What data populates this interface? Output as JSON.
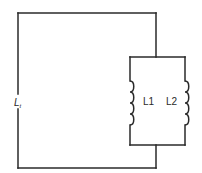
{
  "diagram": {
    "type": "circuit",
    "labels": {
      "total": {
        "main": "L",
        "subscript": "t"
      },
      "inductor1": "L1",
      "inductor2": "L2"
    },
    "components": [
      {
        "id": "L1",
        "kind": "inductor",
        "turns": 4,
        "orientation": "vertical"
      },
      {
        "id": "L2",
        "kind": "inductor",
        "turns": 4,
        "orientation": "vertical"
      }
    ],
    "connection": "parallel",
    "colors": {
      "line": "#2a2a2a",
      "background": "#ffffff"
    }
  }
}
